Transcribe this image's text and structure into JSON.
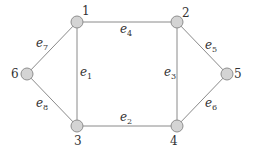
{
  "diagram": {
    "type": "undirected-graph",
    "nodes": [
      {
        "id": "1",
        "label": "1",
        "x": 77,
        "y": 22,
        "lx": 82,
        "ly": 15
      },
      {
        "id": "2",
        "label": "2",
        "x": 177,
        "y": 22,
        "lx": 182,
        "ly": 17
      },
      {
        "id": "3",
        "label": "3",
        "x": 77,
        "y": 126,
        "lx": 74,
        "ly": 145
      },
      {
        "id": "4",
        "label": "4",
        "x": 177,
        "y": 126,
        "lx": 170,
        "ly": 145
      },
      {
        "id": "5",
        "label": "5",
        "x": 227,
        "y": 74,
        "lx": 234,
        "ly": 78
      },
      {
        "id": "6",
        "label": "6",
        "x": 27,
        "y": 74,
        "lx": 11,
        "ly": 78
      }
    ],
    "edges": [
      {
        "id": "e1",
        "from": "1",
        "to": "3",
        "label": "e",
        "sub": "1",
        "lx": 80,
        "ly": 76
      },
      {
        "id": "e2",
        "from": "3",
        "to": "4",
        "label": "e",
        "sub": "2",
        "lx": 120,
        "ly": 121
      },
      {
        "id": "e3",
        "from": "2",
        "to": "4",
        "label": "e",
        "sub": "3",
        "lx": 164,
        "ly": 76
      },
      {
        "id": "e4",
        "from": "1",
        "to": "2",
        "label": "e",
        "sub": "4",
        "lx": 120,
        "ly": 33
      },
      {
        "id": "e5",
        "from": "2",
        "to": "5",
        "label": "e",
        "sub": "5",
        "lx": 205,
        "ly": 49
      },
      {
        "id": "e6",
        "from": "4",
        "to": "5",
        "label": "e",
        "sub": "6",
        "lx": 205,
        "ly": 107
      },
      {
        "id": "e7",
        "from": "1",
        "to": "6",
        "label": "e",
        "sub": "7",
        "lx": 36,
        "ly": 47
      },
      {
        "id": "e8",
        "from": "6",
        "to": "3",
        "label": "e",
        "sub": "8",
        "lx": 36,
        "ly": 107
      }
    ]
  }
}
